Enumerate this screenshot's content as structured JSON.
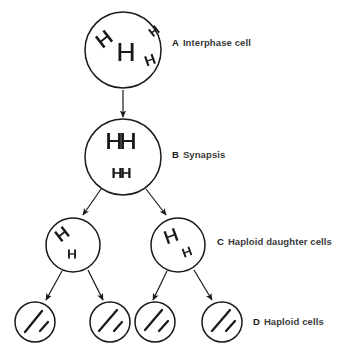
{
  "diagram": {
    "background_color": "#ffffff",
    "stroke_color": "#1a1a1a",
    "label_color": "#3a3a3a",
    "stages": [
      {
        "letter": "A",
        "caption": "Interphase cell",
        "label_x": 172,
        "label_y": 38,
        "cells": [
          {
            "cx": 123,
            "cy": 50,
            "r": 38,
            "chromosomes": [
              {
                "kind": "h-shape",
                "x": 104,
                "y": 39,
                "size": 14,
                "rotate": -38,
                "weight": 2.6
              },
              {
                "kind": "h-shape",
                "x": 154,
                "y": 31,
                "size": 9,
                "rotate": -38,
                "weight": 1.9
              },
              {
                "kind": "h-shape",
                "x": 126,
                "y": 52,
                "size": 18,
                "rotate": 0,
                "weight": 2.8
              },
              {
                "kind": "h-shape",
                "x": 150,
                "y": 60,
                "size": 10,
                "rotate": -20,
                "weight": 2.1
              }
            ]
          }
        ]
      },
      {
        "letter": "B",
        "caption": "Synapsis",
        "label_x": 172,
        "label_y": 150,
        "cells": [
          {
            "cx": 123,
            "cy": 157,
            "r": 38,
            "chromosomes": [
              {
                "kind": "h-shape",
                "x": 114,
                "y": 141,
                "size": 16,
                "rotate": 0,
                "weight": 2.8
              },
              {
                "kind": "h-shape",
                "x": 128,
                "y": 141,
                "size": 16,
                "rotate": 0,
                "weight": 2.8
              },
              {
                "kind": "h-shape",
                "x": 117,
                "y": 173,
                "size": 10,
                "rotate": 0,
                "weight": 2.3
              },
              {
                "kind": "h-shape",
                "x": 126,
                "y": 173,
                "size": 10,
                "rotate": 0,
                "weight": 2.3
              }
            ]
          }
        ]
      },
      {
        "letter": "C",
        "caption": "Haploid daughter cells",
        "label_x": 217,
        "label_y": 237,
        "cells": [
          {
            "cx": 73,
            "cy": 245,
            "r": 27,
            "chromosomes": [
              {
                "kind": "h-shape",
                "x": 62,
                "y": 234,
                "size": 12,
                "rotate": -38,
                "weight": 2.5
              },
              {
                "kind": "h-shape",
                "x": 72,
                "y": 254,
                "size": 9,
                "rotate": 0,
                "weight": 1.9
              }
            ]
          },
          {
            "cx": 178,
            "cy": 245,
            "r": 27,
            "chromosomes": [
              {
                "kind": "h-shape",
                "x": 171,
                "y": 236,
                "size": 13,
                "rotate": -20,
                "weight": 2.4
              },
              {
                "kind": "h-shape",
                "x": 187,
                "y": 252,
                "size": 9,
                "rotate": -20,
                "weight": 1.9
              }
            ]
          }
        ]
      },
      {
        "letter": "D",
        "caption": "Haploid cells",
        "label_x": 253,
        "label_y": 317,
        "cells": [
          {
            "cx": 35,
            "cy": 322,
            "r": 20,
            "chromosomes": [
              {
                "kind": "line",
                "x1": 25,
                "y1": 332,
                "x2": 42,
                "y2": 311,
                "weight": 2.3
              },
              {
                "kind": "line",
                "x1": 40,
                "y1": 331,
                "x2": 48,
                "y2": 322,
                "weight": 2.3
              }
            ]
          },
          {
            "cx": 110,
            "cy": 322,
            "r": 20,
            "chromosomes": [
              {
                "kind": "line",
                "x1": 99,
                "y1": 331,
                "x2": 117,
                "y2": 310,
                "weight": 2.3
              },
              {
                "kind": "line",
                "x1": 114,
                "y1": 331,
                "x2": 122,
                "y2": 322,
                "weight": 2.3
              }
            ]
          },
          {
            "cx": 155,
            "cy": 322,
            "r": 20,
            "chromosomes": [
              {
                "kind": "line",
                "x1": 145,
                "y1": 330,
                "x2": 162,
                "y2": 310,
                "weight": 2.3
              },
              {
                "kind": "line",
                "x1": 159,
                "y1": 331,
                "x2": 168,
                "y2": 321,
                "weight": 2.3
              }
            ]
          },
          {
            "cx": 222,
            "cy": 322,
            "r": 20,
            "chromosomes": [
              {
                "kind": "line",
                "x1": 212,
                "y1": 331,
                "x2": 230,
                "y2": 310,
                "weight": 2.3
              },
              {
                "kind": "line",
                "x1": 226,
                "y1": 331,
                "x2": 235,
                "y2": 321,
                "weight": 2.3
              }
            ]
          }
        ]
      }
    ],
    "arrows": [
      {
        "name": "arrow-a-to-b",
        "x1": 123,
        "y1": 90,
        "x2": 123,
        "y2": 117
      },
      {
        "name": "arrow-b-to-c-left",
        "x1": 101,
        "y1": 189,
        "x2": 83,
        "y2": 215
      },
      {
        "name": "arrow-b-to-c-right",
        "x1": 146,
        "y1": 189,
        "x2": 166,
        "y2": 215
      },
      {
        "name": "arrow-c-left-to-d-1",
        "x1": 62,
        "y1": 271,
        "x2": 46,
        "y2": 300
      },
      {
        "name": "arrow-c-left-to-d-2",
        "x1": 88,
        "y1": 270,
        "x2": 103,
        "y2": 300
      },
      {
        "name": "arrow-c-right-to-d-3",
        "x1": 167,
        "y1": 271,
        "x2": 153,
        "y2": 300
      },
      {
        "name": "arrow-c-right-to-d-4",
        "x1": 194,
        "y1": 270,
        "x2": 212,
        "y2": 300
      }
    ]
  }
}
